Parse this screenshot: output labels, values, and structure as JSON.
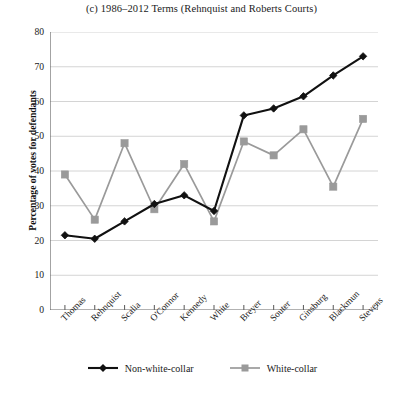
{
  "chart_data": {
    "type": "line",
    "title": "(c) 1986–2012 Terms (Rehnquist and Roberts Courts)",
    "xlabel": "",
    "ylabel": "Percentage of votes for defendants",
    "ylim": [
      0,
      80
    ],
    "yticks": [
      0,
      10,
      20,
      30,
      40,
      50,
      60,
      70,
      80
    ],
    "grid": true,
    "legend_position": "bottom",
    "categories": [
      "Thomas",
      "Rehnquist",
      "Scalia",
      "O'Connor",
      "Kennedy",
      "White",
      "Breyer",
      "Souter",
      "Ginsburg",
      "Blackmun",
      "Stevens"
    ],
    "series": [
      {
        "name": "Non-white-collar",
        "color": "#111111",
        "marker": "diamond",
        "values": [
          21.5,
          20.5,
          25.5,
          30.5,
          33.0,
          28.5,
          56.0,
          58.0,
          61.5,
          67.5,
          73.0
        ]
      },
      {
        "name": "White-collar",
        "color": "#9a9a9a",
        "marker": "square",
        "values": [
          39.0,
          26.0,
          48.0,
          29.0,
          42.0,
          25.5,
          48.5,
          44.5,
          52.0,
          35.5,
          55.0
        ]
      }
    ]
  },
  "legend": {
    "entries": [
      {
        "label": "Non-white-collar"
      },
      {
        "label": "White-collar"
      }
    ]
  }
}
